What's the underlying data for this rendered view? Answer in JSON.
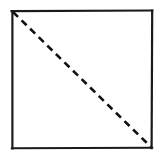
{
  "figure": {
    "title": "Square with dashed diagonal",
    "caption": "",
    "canvas": {
      "width": 164,
      "height": 157,
      "background_color": "#ffffff"
    },
    "style": {
      "stroke_color": "#1a1a1a",
      "border_stroke_width": 2.2,
      "diagonal_stroke_color": "#111111",
      "diagonal_stroke_width": 2.6,
      "dash_length": 7,
      "dash_gap": 5,
      "line_cap": "butt",
      "hand_drawn": true
    },
    "shapes": [
      {
        "name": "square-outline",
        "type": "square",
        "fill": "none",
        "stroke": "#1a1a1a",
        "corners": {
          "top_left": [
            12,
            11
          ],
          "top_right": [
            152,
            11
          ],
          "bottom_right": [
            152,
            148
          ],
          "bottom_left": [
            12,
            148
          ]
        },
        "width": 140,
        "height": 137
      },
      {
        "name": "diagonal-dashed-line",
        "type": "line",
        "style": "dashed",
        "stroke": "#111111",
        "from": [
          13,
          12
        ],
        "to": [
          151,
          147
        ],
        "from_corner": "top_left",
        "to_corner": "bottom_right"
      }
    ]
  }
}
